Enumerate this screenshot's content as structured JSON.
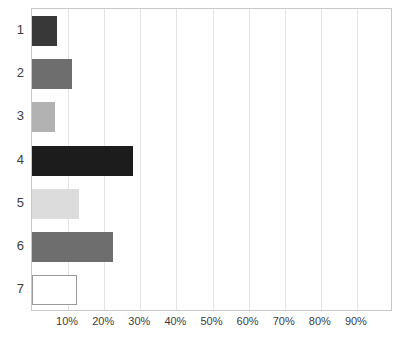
{
  "chart_data": {
    "type": "bar",
    "orientation": "horizontal",
    "title": "",
    "subtitle": "",
    "xlabel": "",
    "ylabel": "",
    "categories": [
      "1",
      "2",
      "3",
      "4",
      "5",
      "6",
      "7"
    ],
    "values": [
      7,
      11,
      6.5,
      28,
      13,
      22.5,
      12.5
    ],
    "value_suffix": "%",
    "xlim": [
      0,
      100
    ],
    "xticks": [
      10,
      20,
      30,
      40,
      50,
      60,
      70,
      80,
      90
    ],
    "xticklabels": [
      "10%",
      "20%",
      "30%",
      "40%",
      "50%",
      "60%",
      "70%",
      "80%",
      "90%"
    ],
    "yticklabels": [
      "1",
      "2",
      "3",
      "4",
      "5",
      "6",
      "7"
    ],
    "grid": "vertical-only",
    "legend": "none",
    "bar_colors": [
      "#383838",
      "#6e6e6e",
      "#b2b2b2",
      "#1c1c1c",
      "#dcdcdc",
      "#6e6e6e",
      "#ffffff"
    ],
    "bar_edge_colors": [
      "#383838",
      "#6e6e6e",
      "#b2b2b2",
      "#1c1c1c",
      "#dcdcdc",
      "#6e6e6e",
      "#9a9a9a"
    ],
    "series": [
      {
        "name": "series-1",
        "points": [
          {
            "category": "1",
            "value": 7,
            "label": "7%",
            "color": "#383838"
          },
          {
            "category": "2",
            "value": 11,
            "label": "11%",
            "color": "#6e6e6e"
          },
          {
            "category": "3",
            "value": 6.5,
            "label": "6.5%",
            "color": "#b2b2b2"
          },
          {
            "category": "4",
            "value": 28,
            "label": "28%",
            "color": "#1c1c1c"
          },
          {
            "category": "5",
            "value": 13,
            "label": "13%",
            "color": "#dcdcdc"
          },
          {
            "category": "6",
            "value": 22.5,
            "label": "22.5%",
            "color": "#6e6e6e"
          },
          {
            "category": "7",
            "value": 12.5,
            "label": "12.5%",
            "color": "#ffffff"
          }
        ]
      }
    ]
  },
  "style": {
    "plot_background": "#ffffff",
    "frame_color": "#c8c8c8",
    "grid_color": "#e4e4e4",
    "tick_label_color": "#3d3d3d"
  }
}
